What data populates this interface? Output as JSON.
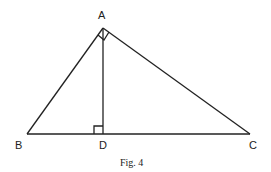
{
  "figure": {
    "caption": "Fig. 4",
    "points": {
      "A": {
        "label": "A",
        "x": 103,
        "y": 28
      },
      "B": {
        "label": "B",
        "x": 27,
        "y": 134
      },
      "C": {
        "label": "C",
        "x": 250,
        "y": 134
      },
      "D": {
        "label": "D",
        "x": 103,
        "y": 134
      }
    },
    "segments": [
      "AB",
      "AC",
      "BC",
      "AD"
    ],
    "right_angles": [
      "BAC",
      "ADB"
    ]
  }
}
